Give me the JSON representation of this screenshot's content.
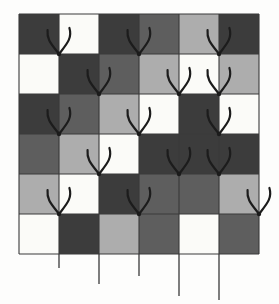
{
  "figure": {
    "name": "grayscale-grid-with-fork-marks",
    "type": "diagram",
    "canvas": {
      "width": 279,
      "height": 304,
      "background": "#fdfdfc"
    },
    "grid": {
      "origin_x": 19,
      "origin_y": 14,
      "cell_width": 40,
      "cell_height": 40,
      "rows": 6,
      "cols": 6,
      "line_color": "#3a3a3a",
      "line_width": 1.1,
      "outline_color": "#3a3a3a"
    },
    "palette": {
      "dark": "#3c3c3c",
      "mid": "#5e5e5e",
      "light": "#adadad",
      "white": "#fbfbf8",
      "ink": "#1c1c1c"
    },
    "cell_shades": [
      [
        "dark",
        "white",
        "dark",
        "mid",
        "light",
        "dark"
      ],
      [
        "white",
        "dark",
        "mid",
        "light",
        "white",
        "light"
      ],
      [
        "dark",
        "mid",
        "light",
        "white",
        "dark",
        "white"
      ],
      [
        "mid",
        "light",
        "white",
        "dark",
        "dark",
        "dark"
      ],
      [
        "light",
        "white",
        "dark",
        "mid",
        "mid",
        "light"
      ],
      [
        "white",
        "dark",
        "light",
        "mid",
        "white",
        "mid"
      ]
    ],
    "forks": {
      "color": "#1c1c1c",
      "stroke_width": 2.2,
      "node_radius": 2.2,
      "arm_height": 26,
      "arm_spread": 13,
      "items": [
        {
          "col": 1,
          "row": 1
        },
        {
          "col": 3,
          "row": 1
        },
        {
          "col": 5,
          "row": 1
        },
        {
          "col": 2,
          "row": 2
        },
        {
          "col": 4,
          "row": 2
        },
        {
          "col": 5,
          "row": 2
        },
        {
          "col": 1,
          "row": 3
        },
        {
          "col": 3,
          "row": 3
        },
        {
          "col": 5,
          "row": 3
        },
        {
          "col": 2,
          "row": 4
        },
        {
          "col": 4,
          "row": 4
        },
        {
          "col": 5,
          "row": 4
        },
        {
          "col": 1,
          "row": 5
        },
        {
          "col": 3,
          "row": 5
        },
        {
          "col": 6,
          "row": 5
        }
      ]
    },
    "stems": {
      "color": "#3a3a3a",
      "stroke_width": 1.3,
      "items": [
        {
          "col": 1,
          "length": 14
        },
        {
          "col": 2,
          "length": 30
        },
        {
          "col": 3,
          "length": 22
        },
        {
          "col": 4,
          "length": 42
        },
        {
          "col": 5,
          "length": 46
        }
      ]
    }
  }
}
